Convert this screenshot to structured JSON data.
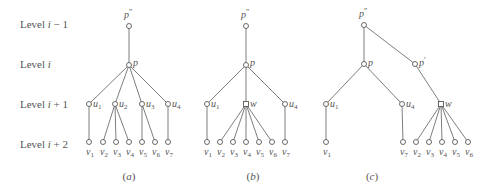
{
  "levels": [
    {
      "prefix": "Level ",
      "var": "i",
      "suffix": " − 1",
      "y": 24
    },
    {
      "prefix": "Level ",
      "var": "i",
      "suffix": "",
      "y": 64
    },
    {
      "prefix": "Level ",
      "var": "i",
      "suffix": " + 1",
      "y": 104
    },
    {
      "prefix": "Level ",
      "var": "i",
      "suffix": " + 2",
      "y": 144
    }
  ],
  "captions": [
    {
      "open": "(",
      "letter": "a",
      "close": ")",
      "x": 129
    },
    {
      "open": "(",
      "letter": "b",
      "close": ")",
      "x": 253
    },
    {
      "open": "(",
      "letter": "c",
      "close": ")",
      "x": 372
    }
  ],
  "colors": {
    "line": "#6e6e6e",
    "text": "#555555",
    "background": "#ffffff"
  },
  "trees": [
    {
      "id": "a",
      "nodes": [
        {
          "id": "p2",
          "name": "p",
          "sup": "″",
          "x": 129,
          "y": 26,
          "lx": 124,
          "ly": 18,
          "labelPos": "top"
        },
        {
          "id": "p",
          "name": "p",
          "x": 129,
          "y": 65,
          "lx": 133,
          "ly": 66
        },
        {
          "id": "u1",
          "name": "u",
          "sub": "1",
          "x": 89,
          "y": 104,
          "lx": 93,
          "ly": 107
        },
        {
          "id": "u2",
          "name": "u",
          "sub": "2",
          "x": 115,
          "y": 104,
          "lx": 119,
          "ly": 107
        },
        {
          "id": "u3",
          "name": "u",
          "sub": "3",
          "x": 142,
          "y": 104,
          "lx": 146,
          "ly": 107
        },
        {
          "id": "u4",
          "name": "u",
          "sub": "4",
          "x": 168,
          "y": 104,
          "lx": 172,
          "ly": 107
        },
        {
          "id": "v1",
          "name": "v",
          "sub": "1",
          "x": 89,
          "y": 142,
          "lx": 86,
          "ly": 155
        },
        {
          "id": "v2",
          "name": "v",
          "sub": "2",
          "x": 103,
          "y": 142,
          "lx": 100,
          "ly": 155
        },
        {
          "id": "v3",
          "name": "v",
          "sub": "3",
          "x": 116,
          "y": 142,
          "lx": 113,
          "ly": 155
        },
        {
          "id": "v4",
          "name": "v",
          "sub": "4",
          "x": 129,
          "y": 142,
          "lx": 126,
          "ly": 155
        },
        {
          "id": "v5",
          "name": "v",
          "sub": "5",
          "x": 142,
          "y": 142,
          "lx": 139,
          "ly": 155
        },
        {
          "id": "v6",
          "name": "v",
          "sub": "6",
          "x": 155,
          "y": 142,
          "lx": 152,
          "ly": 155
        },
        {
          "id": "v7",
          "name": "v",
          "sub": "7",
          "x": 168,
          "y": 142,
          "lx": 165,
          "ly": 155
        }
      ],
      "edges": [
        [
          "p2",
          "p"
        ],
        [
          "p",
          "u1"
        ],
        [
          "p",
          "u2"
        ],
        [
          "p",
          "u3"
        ],
        [
          "p",
          "u4"
        ],
        [
          "u1",
          "v1"
        ],
        [
          "u2",
          "v2"
        ],
        [
          "u2",
          "v3"
        ],
        [
          "u2",
          "v4"
        ],
        [
          "u3",
          "v5"
        ],
        [
          "u3",
          "v6"
        ],
        [
          "u4",
          "v7"
        ]
      ]
    },
    {
      "id": "b",
      "nodes": [
        {
          "id": "p2",
          "name": "p",
          "sup": "″",
          "x": 246,
          "y": 26,
          "lx": 241,
          "ly": 18
        },
        {
          "id": "p",
          "name": "p",
          "x": 246,
          "y": 65,
          "lx": 250,
          "ly": 66
        },
        {
          "id": "u1",
          "name": "u",
          "sub": "1",
          "x": 207,
          "y": 104,
          "lx": 211,
          "ly": 107
        },
        {
          "id": "w",
          "name": "w",
          "x": 246,
          "y": 104,
          "lx": 250,
          "ly": 107,
          "square": true
        },
        {
          "id": "u4",
          "name": "u",
          "sub": "4",
          "x": 285,
          "y": 104,
          "lx": 289,
          "ly": 107
        },
        {
          "id": "v1",
          "name": "v",
          "sub": "1",
          "x": 207,
          "y": 142,
          "lx": 204,
          "ly": 155
        },
        {
          "id": "v2",
          "name": "v",
          "sub": "2",
          "x": 220,
          "y": 142,
          "lx": 217,
          "ly": 155
        },
        {
          "id": "v3",
          "name": "v",
          "sub": "3",
          "x": 233,
          "y": 142,
          "lx": 230,
          "ly": 155
        },
        {
          "id": "v4",
          "name": "v",
          "sub": "4",
          "x": 246,
          "y": 142,
          "lx": 243,
          "ly": 155
        },
        {
          "id": "v5",
          "name": "v",
          "sub": "5",
          "x": 259,
          "y": 142,
          "lx": 256,
          "ly": 155
        },
        {
          "id": "v6",
          "name": "v",
          "sub": "6",
          "x": 272,
          "y": 142,
          "lx": 269,
          "ly": 155
        },
        {
          "id": "v7",
          "name": "v",
          "sub": "7",
          "x": 285,
          "y": 142,
          "lx": 282,
          "ly": 155
        }
      ],
      "edges": [
        [
          "p2",
          "p"
        ],
        [
          "p",
          "u1"
        ],
        [
          "p",
          "w"
        ],
        [
          "p",
          "u4"
        ],
        [
          "u1",
          "v1"
        ],
        [
          "w",
          "v2"
        ],
        [
          "w",
          "v3"
        ],
        [
          "w",
          "v4"
        ],
        [
          "w",
          "v5"
        ],
        [
          "w",
          "v6"
        ],
        [
          "u4",
          "v7"
        ]
      ]
    },
    {
      "id": "c",
      "nodes": [
        {
          "id": "p2",
          "name": "p",
          "sup": "″",
          "x": 364,
          "y": 25,
          "lx": 359,
          "ly": 17
        },
        {
          "id": "p",
          "name": "p",
          "x": 364,
          "y": 64,
          "lx": 368,
          "ly": 66
        },
        {
          "id": "pp",
          "name": "p",
          "sup": "′",
          "x": 415,
          "y": 64,
          "lx": 419,
          "ly": 66
        },
        {
          "id": "u1",
          "name": "u",
          "sub": "1",
          "x": 326,
          "y": 104,
          "lx": 330,
          "ly": 107
        },
        {
          "id": "u4",
          "name": "u",
          "sub": "4",
          "x": 402,
          "y": 104,
          "lx": 406,
          "ly": 107
        },
        {
          "id": "w",
          "name": "w",
          "x": 441,
          "y": 104,
          "lx": 445,
          "ly": 107,
          "square": true
        },
        {
          "id": "v1",
          "name": "v",
          "sub": "1",
          "x": 326,
          "y": 142,
          "lx": 323,
          "ly": 155
        },
        {
          "id": "v7",
          "name": "v",
          "sub": "7",
          "x": 403,
          "y": 142,
          "lx": 400,
          "ly": 155
        },
        {
          "id": "v2",
          "name": "v",
          "sub": "2",
          "x": 416,
          "y": 142,
          "lx": 413,
          "ly": 155
        },
        {
          "id": "v3",
          "name": "v",
          "sub": "3",
          "x": 429,
          "y": 142,
          "lx": 426,
          "ly": 155
        },
        {
          "id": "v4",
          "name": "v",
          "sub": "4",
          "x": 442,
          "y": 142,
          "lx": 439,
          "ly": 155
        },
        {
          "id": "v5",
          "name": "v",
          "sub": "5",
          "x": 455,
          "y": 142,
          "lx": 452,
          "ly": 155
        },
        {
          "id": "v6",
          "name": "v",
          "sub": "6",
          "x": 468,
          "y": 142,
          "lx": 465,
          "ly": 155
        }
      ],
      "edges": [
        [
          "p2",
          "p"
        ],
        [
          "p2",
          "pp"
        ],
        [
          "p",
          "u1"
        ],
        [
          "p",
          "u4"
        ],
        [
          "pp",
          "w"
        ],
        [
          "u1",
          "v1"
        ],
        [
          "u4",
          "v7"
        ],
        [
          "w",
          "v2"
        ],
        [
          "w",
          "v3"
        ],
        [
          "w",
          "v4"
        ],
        [
          "w",
          "v5"
        ],
        [
          "w",
          "v6"
        ]
      ]
    }
  ]
}
